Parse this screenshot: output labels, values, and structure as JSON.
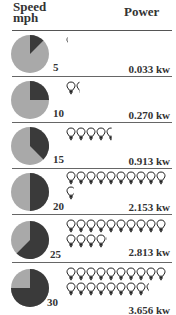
{
  "header": {
    "speed_label": "Speed",
    "speed_unit": "mph",
    "power_label": "Power"
  },
  "colors": {
    "pie_light": "#a9a9a9",
    "pie_dark": "#3a3a3a",
    "rule": "#555555",
    "bulb": "#222222"
  },
  "legend_note": "each bulb = 200 W",
  "rows": [
    {
      "speed": "5",
      "power": "0.033 kw",
      "fraction": 0.125,
      "bulbs": 0.165
    },
    {
      "speed": "10",
      "power": "0.270 kw",
      "fraction": 0.25,
      "bulbs": 1.35
    },
    {
      "speed": "15",
      "power": "0.913 kw",
      "fraction": 0.375,
      "bulbs": 4.565
    },
    {
      "speed": "20",
      "power": "2.153 kw",
      "fraction": 0.5,
      "bulbs": 10.765
    },
    {
      "speed": "25",
      "power": "2.813 kw",
      "fraction": 0.625,
      "bulbs": 14.065
    },
    {
      "speed": "30",
      "power": "3.656 kw",
      "fraction": 0.75,
      "bulbs": 18.28
    }
  ],
  "chart_data": {
    "type": "pie",
    "title": "",
    "xlabel": "Speed mph",
    "ylabel": "Power",
    "categories": [
      "5",
      "10",
      "15",
      "20",
      "25",
      "30"
    ],
    "series": [
      {
        "name": "Power (kW)",
        "values": [
          0.033,
          0.27,
          0.913,
          2.153,
          2.813,
          3.656
        ]
      },
      {
        "name": "Pie dark fraction",
        "values": [
          0.125,
          0.25,
          0.375,
          0.5,
          0.625,
          0.75
        ]
      },
      {
        "name": "Light bulbs (200 W each)",
        "values": [
          0.165,
          1.35,
          4.565,
          10.765,
          14.065,
          18.28
        ]
      }
    ],
    "annotations": [
      "Pictogram: light bulbs represent power output"
    ]
  }
}
